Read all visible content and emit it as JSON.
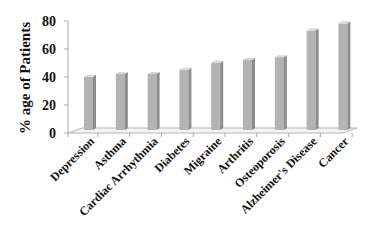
{
  "chart_data": {
    "type": "bar",
    "style": "3d-column",
    "title": "",
    "xlabel": "",
    "ylabel": "% age  of Patients",
    "ylim": [
      0,
      80
    ],
    "yticks": [
      0,
      20,
      40,
      60,
      80
    ],
    "grid": false,
    "legend": null,
    "categories": [
      "Depression",
      "Asthma",
      "Cardiac Arrhythmia",
      "Diabetes",
      "Migraine",
      "Arthritis",
      "Osteoporosis",
      "Alzheimer's Disease",
      "Cancer"
    ],
    "values": [
      38,
      40,
      40,
      43,
      48,
      50,
      52,
      71,
      76
    ],
    "bar_color": "#b3b3b3",
    "bar_side_color": "#8c8c8c",
    "bar_top_color": "#d6d6d6"
  }
}
